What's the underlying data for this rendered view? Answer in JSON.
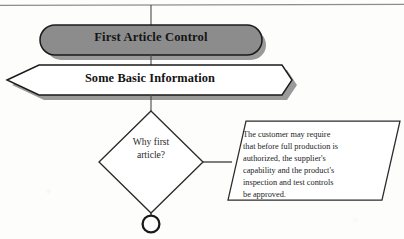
{
  "document": {
    "type": "flowchart-diagram",
    "title": "First Article Control"
  },
  "nodes": {
    "terminator": {
      "shape": "rounded-oval",
      "label": "First Article Control",
      "fill_color": "#8c8c8c",
      "stroke_color": "#1a1a1a",
      "text_color": "#161616",
      "bold": true
    },
    "banner": {
      "shape": "hexagon",
      "label": "Some Basic Information",
      "fill_color": "#ffffff",
      "stroke_color": "#1a1a1a",
      "text_color": "#141414",
      "bold": true
    },
    "decision": {
      "shape": "diamond",
      "label": "Why first\narticle?",
      "fill_color": "#ffffff",
      "stroke_color": "#2b2b2b",
      "text_color": "#2a2a2a",
      "bold": false
    },
    "note": {
      "shape": "parallelogram",
      "label": "The customer may require\nthat before full production is\nauthorized, the supplier's\ncapability and the product's\ninspection and test controls\nbe approved.",
      "fill_color": "#ffffff",
      "stroke_color": "#2b2b2b",
      "text_color": "#232323",
      "bold": false
    },
    "connector": {
      "shape": "circle",
      "label": "",
      "fill_color": "#ffffff",
      "stroke_color": "#1a1a1a"
    }
  },
  "edges": [
    {
      "name": "top-rule-to-terminator",
      "from": "page-top-rule",
      "to": "terminator",
      "style": "solid-line"
    },
    {
      "name": "terminator-to-banner",
      "from": "terminator",
      "to": "banner",
      "style": "solid-line"
    },
    {
      "name": "banner-to-decision",
      "from": "banner",
      "to": "decision",
      "style": "solid-line"
    },
    {
      "name": "decision-to-note",
      "from": "decision",
      "to": "note",
      "style": "solid-line"
    },
    {
      "name": "decision-to-connector",
      "from": "decision",
      "to": "connector",
      "style": "solid-line"
    }
  ],
  "page_rule": {
    "name": "top-horizontal-rule",
    "color": "#8d8d8d"
  },
  "colors": {
    "paper": "#fdfdfc",
    "ink": "#1a1a1a",
    "gray_fill": "#8c8c8c",
    "shadow": "#9a9a9a",
    "rule": "#8d8d8d"
  }
}
